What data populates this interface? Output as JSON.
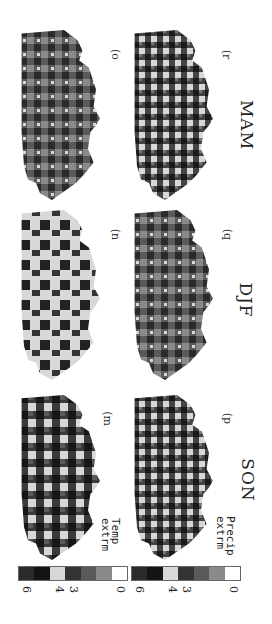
{
  "figure": {
    "orientation": "rotated-90-clockwise",
    "rows": [
      {
        "label_line1": "Temp",
        "label_line2": "extrm"
      },
      {
        "label_line1": "Precip",
        "label_line2": "extrm"
      }
    ],
    "seasons": [
      "SON",
      "DJF",
      "MAM"
    ],
    "panels": [
      {
        "id": "m",
        "label": "(m",
        "row": "Temp extrm",
        "season": "SON"
      },
      {
        "id": "n",
        "label": "(n",
        "row": "Temp extrm",
        "season": "DJF"
      },
      {
        "id": "o",
        "label": "(o",
        "row": "Temp extrm",
        "season": "MAM"
      },
      {
        "id": "p",
        "label": "(p",
        "row": "Precip extrm",
        "season": "SON"
      },
      {
        "id": "q",
        "label": "(q",
        "row": "Precip extrm",
        "season": "DJF"
      },
      {
        "id": "r",
        "label": "(r",
        "row": "Precip extrm",
        "season": "MAM"
      }
    ],
    "colorbar": {
      "ticks": [
        "6",
        "4",
        "3",
        "0"
      ],
      "levels": [
        6,
        5,
        4,
        3,
        2,
        1,
        0
      ],
      "colors": [
        "#2a2a2a",
        "#141414",
        "#d8d8d8",
        "#333333",
        "#5a5a5a",
        "#8a8a8a",
        "#ffffff"
      ]
    }
  }
}
